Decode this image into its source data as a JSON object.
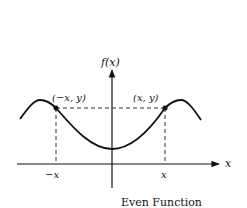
{
  "diagram": {
    "title": "Even Function",
    "y_axis_label": "f(x)",
    "x_axis_label": "x",
    "points": [
      {
        "label": "(−x, y)"
      },
      {
        "label": "(x, y)"
      }
    ],
    "ticks": [
      {
        "label": "−x"
      },
      {
        "label": "x"
      }
    ]
  }
}
